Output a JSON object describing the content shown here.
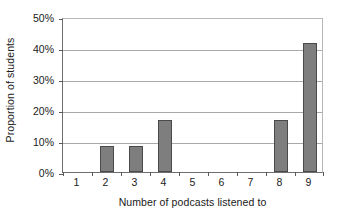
{
  "chart_data": {
    "type": "bar",
    "title": "",
    "xlabel": "Number of podcasts listened to",
    "ylabel": "Proportion of students",
    "categories": [
      "1",
      "2",
      "3",
      "4",
      "5",
      "6",
      "7",
      "8",
      "9"
    ],
    "values": [
      0,
      8.3,
      8.3,
      16.7,
      0,
      0,
      0,
      16.7,
      41.7
    ],
    "value_labels": [
      "0%",
      "8.3%",
      "8.3%",
      "16.7%",
      "0%",
      "0%",
      "0%",
      "16.7%",
      "41.7%"
    ],
    "ylim": [
      0,
      50
    ],
    "y_ticks": [
      0,
      10,
      20,
      30,
      40,
      50
    ],
    "y_tick_labels": [
      "0%",
      "10%",
      "20%",
      "30%",
      "40%",
      "50%"
    ],
    "grid": true,
    "legend": "none",
    "series_color": "#7e7e7e",
    "series_border_color": "#4a4a4a",
    "gridline_color": "#a8a8a8",
    "axis_color": "#6e6e6e",
    "background": "#ffffff"
  }
}
